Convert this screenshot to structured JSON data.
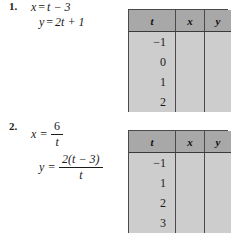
{
  "page": {
    "background_color": "#ffffff",
    "text_color": "#1b1b1b"
  },
  "style": {
    "header_fill": "#a8a8a8",
    "cell_fill": "#cdcdcd",
    "border_color": "#4a4a4a"
  },
  "problems": [
    {
      "number": "1.",
      "equations": [
        {
          "lhs": "x",
          "equals": "=",
          "rhs_plain": "t − 3",
          "type": "plain"
        },
        {
          "lhs": "y",
          "equals": "=",
          "rhs_plain": "2t + 1",
          "type": "plain"
        }
      ],
      "table": {
        "headers": [
          "t",
          "x",
          "y"
        ],
        "rows": [
          {
            "t": "−1",
            "x": "",
            "y": ""
          },
          {
            "t": "0",
            "x": "",
            "y": ""
          },
          {
            "t": "1",
            "x": "",
            "y": ""
          },
          {
            "t": "2",
            "x": "",
            "y": ""
          }
        ]
      }
    },
    {
      "number": "2.",
      "equations": [
        {
          "lhs": "x",
          "equals": "=",
          "type": "fraction",
          "numerator": "6",
          "denominator": "t"
        },
        {
          "lhs": "y",
          "equals": "=",
          "type": "fraction",
          "numerator": "2(t − 3)",
          "denominator": "t"
        }
      ],
      "table": {
        "headers": [
          "t",
          "x",
          "y"
        ],
        "rows": [
          {
            "t": "−1",
            "x": "",
            "y": ""
          },
          {
            "t": "1",
            "x": "",
            "y": ""
          },
          {
            "t": "2",
            "x": "",
            "y": ""
          },
          {
            "t": "3",
            "x": "",
            "y": ""
          }
        ]
      }
    }
  ]
}
